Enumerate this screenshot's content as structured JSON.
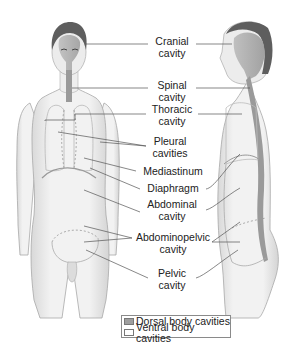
{
  "figure": {
    "views": [
      "anterior-view",
      "lateral-view"
    ],
    "colors": {
      "skin": "#ececec",
      "skin_shadow": "#c9c9c9",
      "outline": "#9a9a9a",
      "dorsal_cavity": "#9e9e9e",
      "hair": "#5e5e5e",
      "leader_line": "#555555",
      "text": "#222222"
    }
  },
  "labels": [
    {
      "id": "cranial",
      "line1": "Cranial",
      "line2": "cavity"
    },
    {
      "id": "spinal",
      "line1": "Spinal",
      "line2": "cavity"
    },
    {
      "id": "thoracic",
      "line1": "Thoracic",
      "line2": "cavity"
    },
    {
      "id": "pleural",
      "line1": "Pleural",
      "line2": "cavities"
    },
    {
      "id": "mediastinum",
      "line1": "Mediastinum",
      "line2": ""
    },
    {
      "id": "diaphragm",
      "line1": "Diaphragm",
      "line2": ""
    },
    {
      "id": "abdominal",
      "line1": "Abdominal",
      "line2": "cavity"
    },
    {
      "id": "abdominopelvic",
      "line1": "Abdominopelvic",
      "line2": "cavity"
    },
    {
      "id": "pelvic",
      "line1": "Pelvic",
      "line2": "cavity"
    }
  ],
  "legend": {
    "items": [
      {
        "label": "Dorsal body cavities",
        "swatch": "#9e9e9e"
      },
      {
        "label": "Ventral body cavities",
        "swatch": "#ffffff"
      }
    ]
  }
}
